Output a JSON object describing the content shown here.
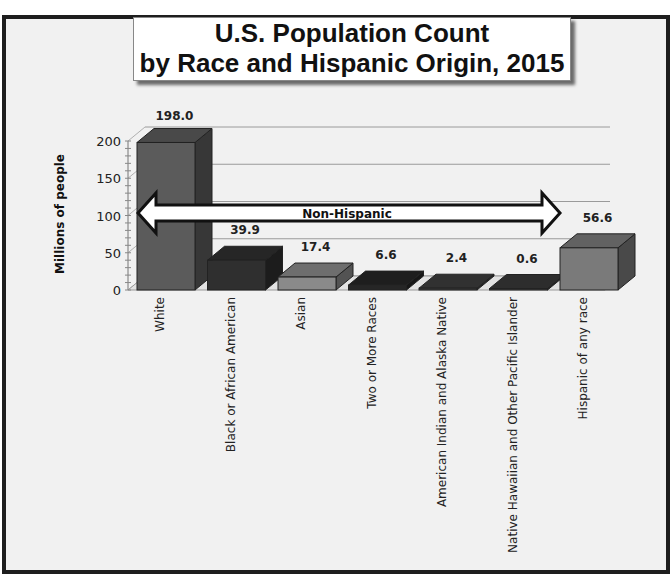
{
  "chart_data": {
    "type": "bar",
    "title": "U.S. Population Count by Race and Hispanic Origin, 2015",
    "title_lines": [
      "U.S. Population Count",
      "by Race and Hispanic Origin, 2015"
    ],
    "xlabel": "",
    "ylabel": "Millions of people",
    "ylim": [
      0,
      200
    ],
    "yticks": [
      0,
      50,
      100,
      150,
      200
    ],
    "grid": true,
    "three_d": true,
    "categories": [
      "White",
      "Black or African American",
      "Asian",
      "Two or More Races",
      "American Indian and Alaska Native",
      "Native Hawaiian and Other Pacific Islander",
      "Hispanic of any race"
    ],
    "values": [
      198.0,
      39.9,
      17.4,
      6.6,
      2.4,
      0.6,
      56.6
    ],
    "data_labels": [
      "198.0",
      "39.9",
      "17.4",
      "6.6",
      "2.4",
      "0.6",
      "56.6"
    ],
    "bar_colors": [
      "#5b5b5b",
      "#2f2f2f",
      "#8a8a8a",
      "#262626",
      "#3d3d3d",
      "#383838",
      "#7a7a7a"
    ],
    "annotation": {
      "text": "Non-Hispanic",
      "type": "double-arrow",
      "spans_categories": [
        "White",
        "Native Hawaiian and Other Pacific Islander"
      ]
    }
  }
}
